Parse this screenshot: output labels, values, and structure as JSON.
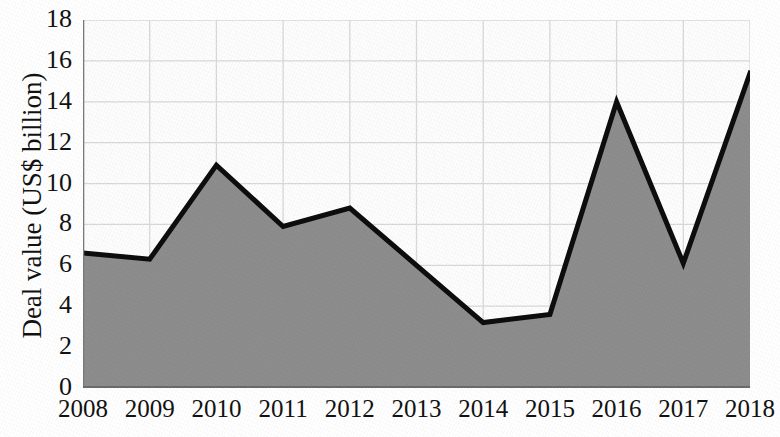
{
  "chart_data": {
    "type": "area",
    "title": "",
    "xlabel": "",
    "ylabel": "Deal value (US$ billion)",
    "categories": [
      "2008",
      "2009",
      "2010",
      "2011",
      "2012",
      "2013",
      "2014",
      "2015",
      "2016",
      "2017",
      "2018"
    ],
    "values": [
      6.6,
      6.3,
      10.9,
      7.9,
      8.8,
      6.0,
      3.2,
      3.6,
      14.0,
      6.1,
      15.4
    ],
    "series": [
      {
        "name": "Deal value",
        "values": [
          6.6,
          6.3,
          10.9,
          7.9,
          8.8,
          6.0,
          3.2,
          3.6,
          14.0,
          6.1,
          15.4
        ]
      }
    ],
    "ylim": [
      0,
      18
    ],
    "yticks": [
      0,
      2,
      4,
      6,
      8,
      10,
      12,
      14,
      16,
      18
    ],
    "ytick_labels": [
      "0",
      "2",
      "4",
      "6",
      "8",
      "10",
      "12",
      "14",
      "16",
      "18"
    ],
    "grid": {
      "horizontal": true,
      "vertical": true,
      "color": "#d9d9d9"
    },
    "legend": {
      "visible": false,
      "position": "none",
      "entries": []
    },
    "colors": {
      "area_fill": "#8d8d8d",
      "line_stroke": "#0d0d0d",
      "plot_background": "#fdfdfd",
      "axis": "#6f6f6f",
      "text": "#121212"
    }
  }
}
